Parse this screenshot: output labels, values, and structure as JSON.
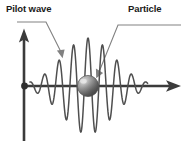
{
  "figure": {
    "title_labels": {
      "pilot_wave": "Pilot wave",
      "particle": "Particle"
    },
    "colors": {
      "background": "#ffffff",
      "axis": "#3a3a3a",
      "wave": "#4d4d4d",
      "leader_line": "#7a7a7a",
      "text": "#1a1a1a",
      "sphere_light": "#d8d8d8",
      "sphere_mid": "#8a8a8a",
      "sphere_dark": "#4a4a4a"
    },
    "axes": {
      "origin_x": 24,
      "origin_y": 86,
      "x_axis_end": 181,
      "y_axis_top": 29,
      "y_axis_bottom": 141,
      "origin_dot_radius": 3.2,
      "arrow_heads": [
        "x-right",
        "y-up"
      ]
    },
    "particle_sphere": {
      "center_x": 88,
      "center_y": 86,
      "radius": 10.5,
      "highlight_x": 83,
      "highlight_y": 81
    },
    "leaders": {
      "pilot_wave": {
        "points": "17,22 46,22 61,52",
        "arrow_tip_x": 62.5,
        "arrow_tip_y": 58,
        "arrow_angle": 63
      },
      "particle": {
        "points": "180,25 118,25 98,72",
        "arrow_tip_x": 96,
        "arrow_tip_y": 77,
        "arrow_angle": 113
      }
    }
  },
  "chart_data": {
    "type": "line",
    "xlabel": "",
    "ylabel": "",
    "grid": false,
    "legend": "none",
    "annotations": [
      {
        "text": "Pilot wave",
        "points_to": "wave crest left of centre"
      },
      {
        "text": "Particle",
        "points_to": "sphere at wave packet centre"
      }
    ],
    "wave_packet": {
      "envelope": "gaussian",
      "center_x": 88,
      "sigma": 26,
      "wavelength": 14.5,
      "peak_amplitude": 48,
      "x_start": 30,
      "x_end": 148,
      "baseline_y": 86
    }
  }
}
